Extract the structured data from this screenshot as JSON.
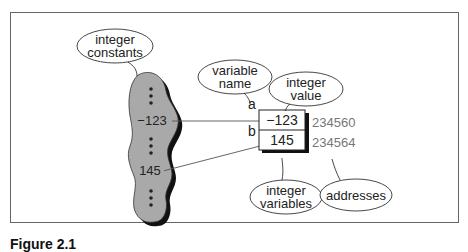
{
  "diagram": {
    "callouts": {
      "integer_constants": [
        "integer",
        "constants"
      ],
      "variable_name": [
        "variable",
        "name"
      ],
      "integer_value": [
        "integer",
        "value"
      ],
      "integer_variables": [
        "integer",
        "variables"
      ],
      "addresses": "addresses"
    },
    "constants_pool": {
      "values": [
        "-123",
        "145"
      ],
      "ellipsis": "⋮"
    },
    "variables": [
      {
        "name": "a",
        "value": "−123",
        "address": "234560"
      },
      {
        "name": "b",
        "value": "145",
        "address": "234564"
      }
    ],
    "constant_labels": {
      "c1": "−123",
      "c2": "145"
    }
  },
  "caption": "Figure 2.1"
}
